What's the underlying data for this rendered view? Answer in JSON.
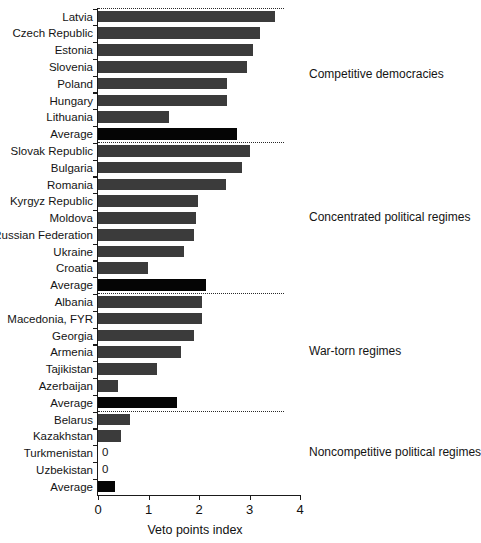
{
  "chart_data": {
    "type": "bar",
    "orientation": "horizontal",
    "title": "",
    "xlabel": "Veto points index",
    "ylabel": "",
    "xlim": [
      0,
      4
    ],
    "xticks": [
      0,
      1,
      2,
      3,
      4
    ],
    "xtick_labels": [
      "0",
      "1",
      "2",
      "3",
      "4"
    ],
    "grid": false,
    "legend": null,
    "colors": {
      "bar": "#3b3b3b",
      "average_bar": "#050505",
      "axis": "#1a1a1a",
      "separator": "#2a2a2a",
      "background": "#ffffff"
    },
    "categories": [
      "Latvia",
      "Czech Republic",
      "Estonia",
      "Slovenia",
      "Poland",
      "Hungary",
      "Lithuania",
      "Average",
      "Slovak Republic",
      "Bulgaria",
      "Romania",
      "Kyrgyz Republic",
      "Moldova",
      "Russian Federation",
      "Ukraine",
      "Croatia",
      "Average",
      "Albania",
      "Macedonia, FYR",
      "Georgia",
      "Armenia",
      "Tajikistan",
      "Azerbaijan",
      "Average",
      "Belarus",
      "Kazakhstan",
      "Turkmenistan",
      "Uzbekistan",
      "Average"
    ],
    "values": [
      3.5,
      3.2,
      3.07,
      2.95,
      2.55,
      2.55,
      1.4,
      2.75,
      3.0,
      2.85,
      2.53,
      1.98,
      1.94,
      1.9,
      1.7,
      0.99,
      2.14,
      2.06,
      2.05,
      1.9,
      1.64,
      1.16,
      0.4,
      1.57,
      0.63,
      0.46,
      0,
      0,
      0.33
    ],
    "point_labels": {
      "Turkmenistan": "0",
      "Uzbekistan": "0"
    },
    "groups": [
      {
        "label": "Competitive democracies",
        "start": 0,
        "end": 7
      },
      {
        "label": "Concentrated political regimes",
        "start": 8,
        "end": 16
      },
      {
        "label": "War-torn regimes",
        "start": 17,
        "end": 23
      },
      {
        "label": "Noncompetitive political regimes",
        "start": 24,
        "end": 28
      }
    ]
  }
}
